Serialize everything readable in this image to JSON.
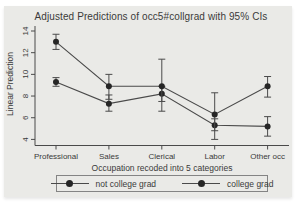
{
  "title": "Adjusted Predictions of occ5#collgrad with 95% CIs",
  "chart_data": {
    "type": "line",
    "title": "Adjusted Predictions of occ5#collgrad with 95% CIs",
    "categories": [
      "Professional",
      "Sales",
      "Clerical",
      "Labor",
      "Other occ"
    ],
    "xlabel": "Occupation recoded into 5 categories",
    "ylabel": "Linear Prediction",
    "ylim": [
      4,
      14
    ],
    "yticks": [
      4,
      6,
      8,
      10,
      12,
      14
    ],
    "grid": false,
    "legend_position": "bottom",
    "error_bars": "95% CI with caps",
    "series": [
      {
        "name": "not college grad",
        "values": [
          9.3,
          7.3,
          8.2,
          5.3,
          5.2
        ],
        "ci_low": [
          8.9,
          6.6,
          7.5,
          4.8,
          4.3
        ],
        "ci_high": [
          9.7,
          8.1,
          8.9,
          5.9,
          6.1
        ]
      },
      {
        "name": "college grad",
        "values": [
          13.0,
          8.9,
          8.9,
          6.3,
          8.9
        ],
        "ci_low": [
          12.3,
          7.7,
          6.6,
          4.0,
          7.9
        ],
        "ci_high": [
          13.7,
          10.0,
          11.4,
          8.3,
          9.8
        ]
      }
    ]
  },
  "colors": {
    "page_background": "#ffffff",
    "graph_background": "#eaeae7",
    "text": "#3a3a3a",
    "axis_line": "#4a4a4a",
    "series_line": "#4a4a4a",
    "marker": "#262626",
    "legend_border": "#848484"
  }
}
